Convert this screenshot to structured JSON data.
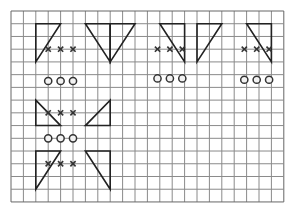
{
  "grid": {
    "x0": 11,
    "y0": 11,
    "cols": 22,
    "rows": 15,
    "cell_w": 12.4,
    "cell_h": 12.73,
    "line_color": "#8a8a8a",
    "border_color": "#666666"
  },
  "colors": {
    "shape_stroke": "#222222",
    "mark_color": "#333333"
  },
  "triangles": [
    {
      "name": "triangle-a1",
      "points": [
        [
          2,
          1
        ],
        [
          4,
          1
        ],
        [
          2,
          4
        ]
      ]
    },
    {
      "name": "triangle-a2",
      "points": [
        [
          6,
          1
        ],
        [
          8,
          1
        ],
        [
          8,
          4
        ]
      ]
    },
    {
      "name": "triangle-b1",
      "points": [
        [
          8,
          1
        ],
        [
          10,
          1
        ],
        [
          8,
          4
        ]
      ]
    },
    {
      "name": "triangle-b2",
      "points": [
        [
          12,
          1
        ],
        [
          14,
          1
        ],
        [
          14,
          4
        ]
      ]
    },
    {
      "name": "triangle-c1",
      "points": [
        [
          15,
          1
        ],
        [
          17,
          1
        ],
        [
          15,
          4
        ]
      ]
    },
    {
      "name": "triangle-c2",
      "points": [
        [
          19,
          1
        ],
        [
          21,
          1
        ],
        [
          21,
          4
        ]
      ]
    },
    {
      "name": "triangle-d1",
      "points": [
        [
          2,
          7
        ],
        [
          4,
          9
        ],
        [
          2,
          9
        ]
      ]
    },
    {
      "name": "triangle-d2",
      "points": [
        [
          8,
          7
        ],
        [
          8,
          9
        ],
        [
          6,
          9
        ]
      ]
    },
    {
      "name": "triangle-e1",
      "points": [
        [
          2,
          11
        ],
        [
          4,
          11
        ],
        [
          2,
          14
        ]
      ]
    },
    {
      "name": "triangle-e2",
      "points": [
        [
          6,
          11
        ],
        [
          8,
          11
        ],
        [
          8,
          14
        ]
      ]
    }
  ],
  "crosses": [
    {
      "row": 3,
      "cols": [
        3,
        4,
        5
      ],
      "group": "a"
    },
    {
      "row": 3,
      "cols": [
        12,
        13,
        14
      ],
      "group": "b",
      "offset": -2.3
    },
    {
      "row": 3,
      "cols": [
        19,
        20,
        21
      ],
      "group": "c",
      "offset": -2.3
    },
    {
      "row": 8,
      "cols": [
        3,
        4,
        5
      ],
      "group": "d"
    },
    {
      "row": 12,
      "cols": [
        3,
        4,
        5
      ],
      "group": "e"
    }
  ],
  "circles": [
    {
      "row": 5.5,
      "cols": [
        3,
        4,
        5
      ],
      "group": "a"
    },
    {
      "row": 5.3,
      "cols": [
        12,
        13,
        14
      ],
      "group": "b",
      "offset": -2.3
    },
    {
      "row": 5.4,
      "cols": [
        19,
        20,
        21
      ],
      "group": "c",
      "offset": -2.3
    },
    {
      "row": 10,
      "cols": [
        3,
        4,
        5
      ],
      "group": "d"
    }
  ]
}
